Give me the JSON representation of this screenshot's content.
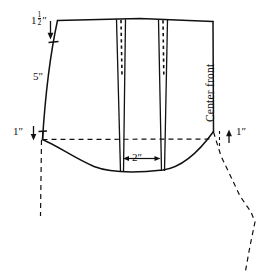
{
  "figure": {
    "background_color": "#ffffff",
    "line_color": "#111111",
    "dash_color": "#111111"
  },
  "labels": {
    "waist_extension": {
      "whole": "1",
      "numerator": "1",
      "denominator": "2",
      "unit": "″"
    },
    "side_seam": "5″",
    "hip_left": "1″",
    "hip_right": "1″",
    "dart_spacing": "2″",
    "center_front": "Center front"
  },
  "measurements": {
    "waist_extension_value": "1 1/2 in",
    "side_seam_value": "5 in",
    "hip_drop_left_value": "1 in",
    "hip_drop_right_value": "1 in",
    "dart_spacing_value": "2 in"
  },
  "geometry": {
    "outline_note": "Skirt front block: waistline top, curved side seam at left, straight center front at right, hip line dashed, curved hem sweep at bottom",
    "darts": [
      {
        "name": "dart-1",
        "apex_x": 121,
        "top_width": 9
      },
      {
        "name": "dart-2",
        "apex_x": 163,
        "top_width": 9
      }
    ],
    "hip_line_y": 139,
    "waist_line_y": 20
  }
}
